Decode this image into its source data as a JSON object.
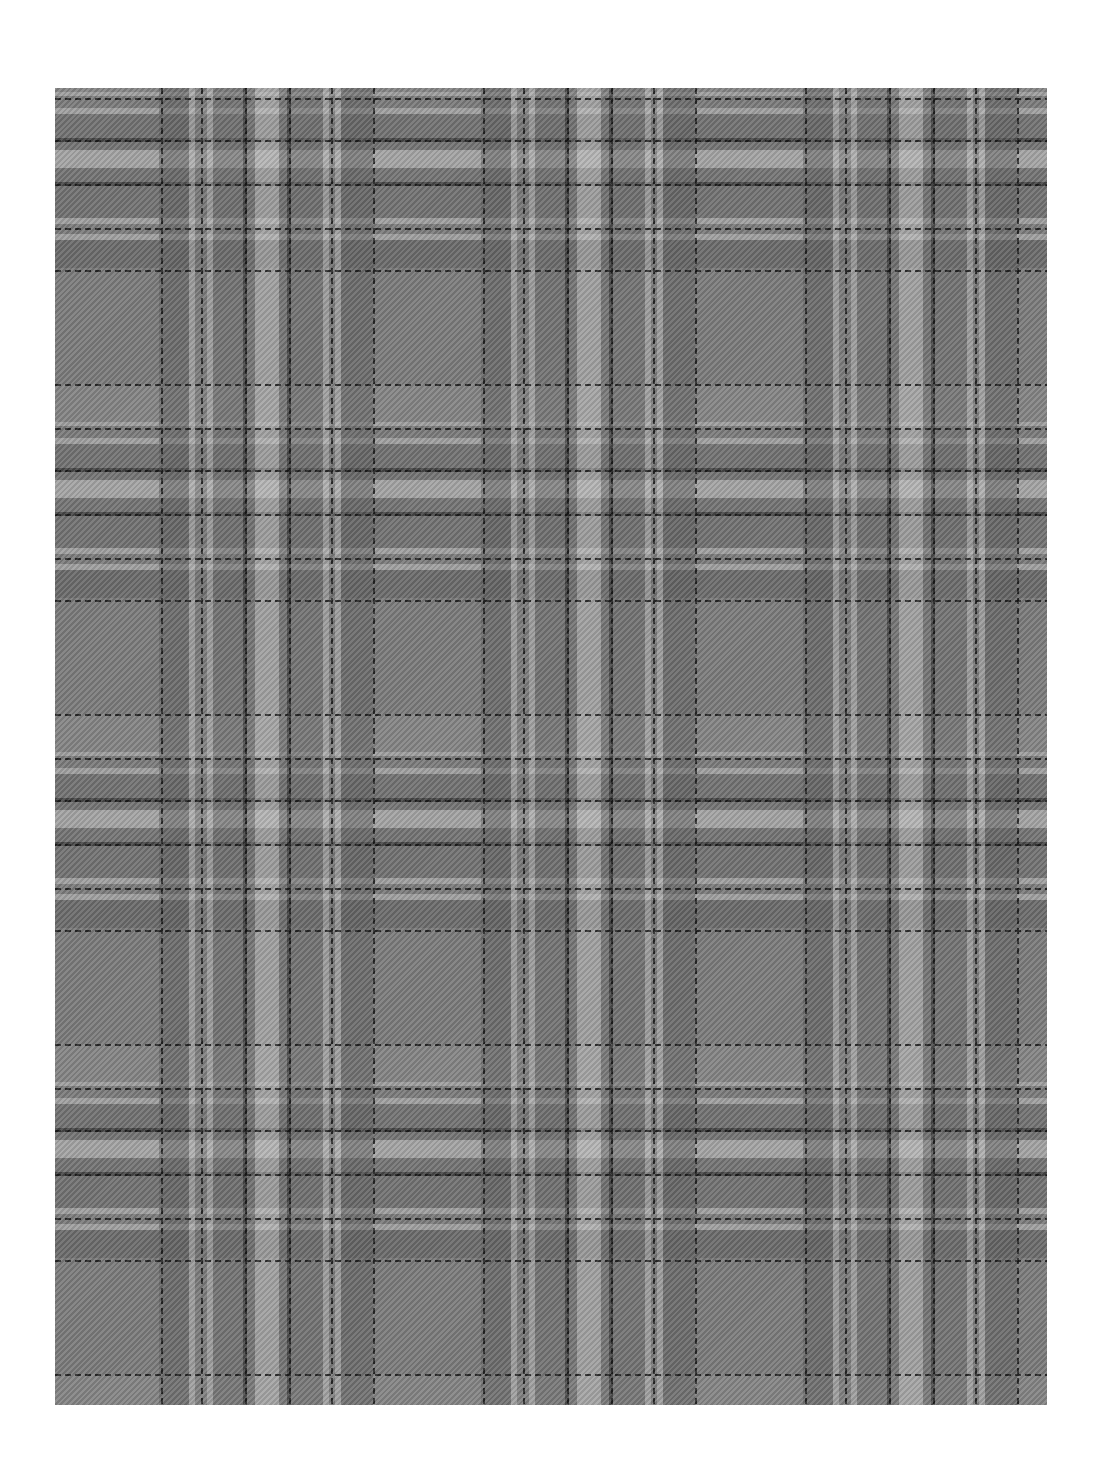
{
  "image": {
    "subject": "gray plaid tartan fabric swatch",
    "palette": {
      "background": "#ffffff",
      "base": "#7a7a7a",
      "dark": "#5c5c5c",
      "light": "#c4c4c4",
      "overcheck": "#1a1a1a"
    },
    "fabric_bounds": {
      "left": 55,
      "top": 88,
      "right": 1047,
      "bottom": 1405
    },
    "repeat": {
      "horizontal_px": 322,
      "vertical_px": 330
    }
  },
  "caption": "Gray plaid fabric"
}
